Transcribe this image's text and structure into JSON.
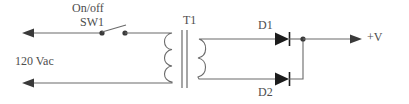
{
  "diagram": {
    "type": "schematic",
    "width": 409,
    "height": 104,
    "background_color": "#ffffff",
    "line_color": "#6a6a6a",
    "text_color": "#4d4d4d",
    "labels": {
      "on_off": "On/off",
      "switch_ref": "SW1",
      "transformer_ref": "T1",
      "diode1_ref": "D1",
      "diode2_ref": "D2",
      "source": "120 Vac",
      "output": "+V"
    },
    "components": [
      {
        "name": "ac-source",
        "ref": "",
        "label": "120 Vac",
        "kind": "ac-input",
        "note": "two leftward arrows on the top and bottom primary leads"
      },
      {
        "name": "switch",
        "ref": "SW1",
        "label": "On/off",
        "kind": "spst-switch",
        "state": "open"
      },
      {
        "name": "transformer",
        "ref": "T1",
        "kind": "iron-core-transformer",
        "primary_bumps": 3,
        "secondary_bumps": 2,
        "core_bars": 2
      },
      {
        "name": "diode-1",
        "ref": "D1",
        "kind": "diode",
        "direction": "right"
      },
      {
        "name": "diode-2",
        "ref": "D2",
        "kind": "diode",
        "direction": "right"
      },
      {
        "name": "output-terminal",
        "ref": "",
        "label": "+V",
        "kind": "output-arrow",
        "direction": "right"
      }
    ],
    "nodes": [
      {
        "name": "switch-left-terminal",
        "x": 102,
        "y": 33
      },
      {
        "name": "switch-right-terminal",
        "x": 125,
        "y": 33
      },
      {
        "name": "output-junction",
        "x": 303,
        "y": 39
      }
    ]
  }
}
